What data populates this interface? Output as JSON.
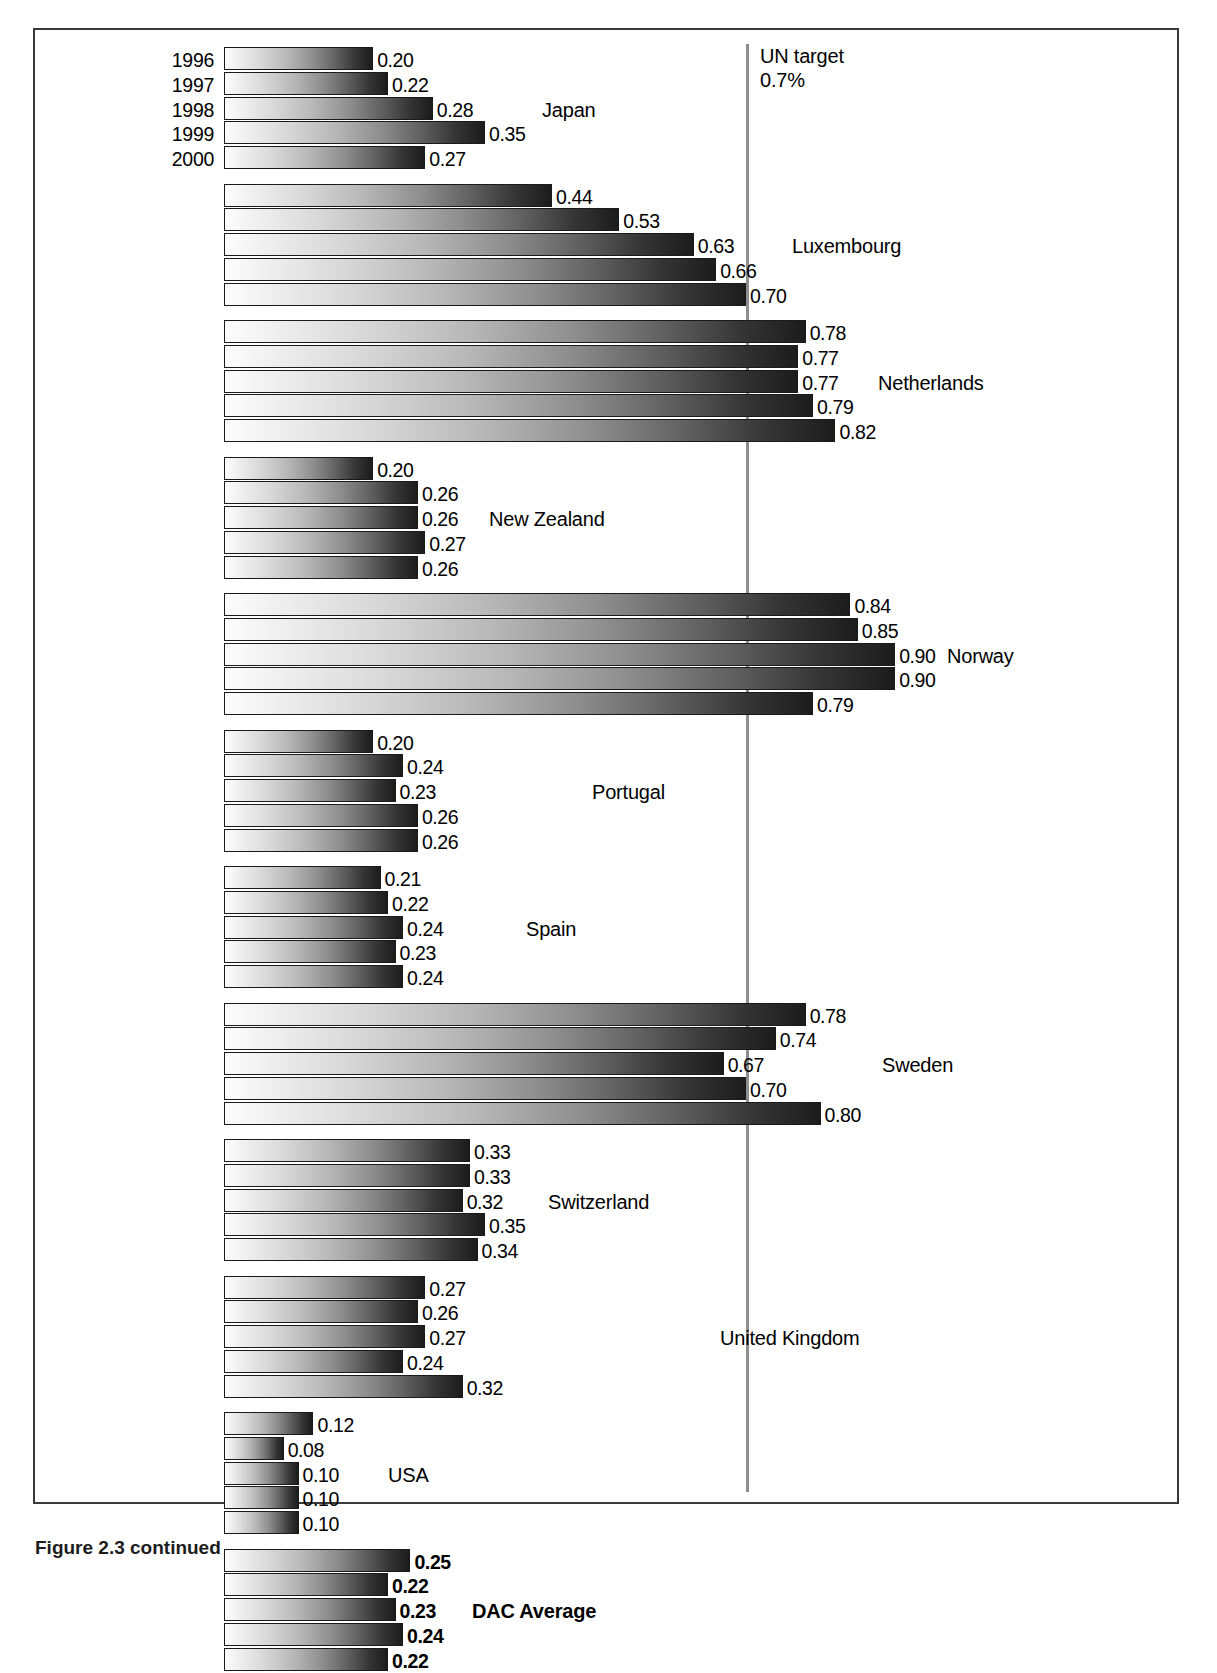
{
  "figure": {
    "caption": "Figure 2.3 continued",
    "years": [
      "1996",
      "1997",
      "1998",
      "1999",
      "2000"
    ],
    "reference_line": {
      "label_line1": "UN target",
      "label_line2": "0.7%",
      "value": 0.7
    }
  },
  "chart_data": {
    "type": "bar",
    "orientation": "horizontal",
    "title": "",
    "xlabel": "",
    "ylabel": "",
    "xlim": [
      0,
      0.9
    ],
    "grid": false,
    "legend": "none",
    "categories": [
      "1996",
      "1997",
      "1998",
      "1999",
      "2000"
    ],
    "reference_line": {
      "label": "UN target 0.7%",
      "value": 0.7
    },
    "groups": [
      {
        "name": "Japan",
        "bold": false,
        "values": [
          0.2,
          0.22,
          0.28,
          0.35,
          0.27
        ],
        "labels": [
          "0.20",
          "0.22",
          "0.28",
          "0.35",
          "0.27"
        ]
      },
      {
        "name": "Luxembourg",
        "bold": false,
        "values": [
          0.44,
          0.53,
          0.63,
          0.66,
          0.7
        ],
        "labels": [
          "0.44",
          "0.53",
          "0.63",
          "0.66",
          "0.70"
        ]
      },
      {
        "name": "Netherlands",
        "bold": false,
        "values": [
          0.78,
          0.77,
          0.77,
          0.79,
          0.82
        ],
        "labels": [
          "0.78",
          "0.77",
          "0.77",
          "0.79",
          "0.82"
        ]
      },
      {
        "name": "New Zealand",
        "bold": false,
        "values": [
          0.2,
          0.26,
          0.26,
          0.27,
          0.26
        ],
        "labels": [
          "0.20",
          "0.26",
          "0.26",
          "0.27",
          "0.26"
        ]
      },
      {
        "name": "Norway",
        "bold": false,
        "values": [
          0.84,
          0.85,
          0.9,
          0.9,
          0.79
        ],
        "labels": [
          "0.84",
          "0.85",
          "0.90",
          "0.90",
          "0.79"
        ]
      },
      {
        "name": "Portugal",
        "bold": false,
        "values": [
          0.2,
          0.24,
          0.23,
          0.26,
          0.26
        ],
        "labels": [
          "0.20",
          "0.24",
          "0.23",
          "0.26",
          "0.26"
        ]
      },
      {
        "name": "Spain",
        "bold": false,
        "values": [
          0.21,
          0.22,
          0.24,
          0.23,
          0.24
        ],
        "labels": [
          "0.21",
          "0.22",
          "0.24",
          "0.23",
          "0.24"
        ]
      },
      {
        "name": "Sweden",
        "bold": false,
        "values": [
          0.78,
          0.74,
          0.67,
          0.7,
          0.8
        ],
        "labels": [
          "0.78",
          "0.74",
          "0.67",
          "0.70",
          "0.80"
        ]
      },
      {
        "name": "Switzerland",
        "bold": false,
        "values": [
          0.33,
          0.33,
          0.32,
          0.35,
          0.34
        ],
        "labels": [
          "0.33",
          "0.33",
          "0.32",
          "0.35",
          "0.34"
        ]
      },
      {
        "name": "United Kingdom",
        "bold": false,
        "values": [
          0.27,
          0.26,
          0.27,
          0.24,
          0.32
        ],
        "labels": [
          "0.27",
          "0.26",
          "0.27",
          "0.24",
          "0.32"
        ]
      },
      {
        "name": "USA",
        "bold": false,
        "values": [
          0.12,
          0.08,
          0.1,
          0.1,
          0.1
        ],
        "labels": [
          "0.12",
          "0.08",
          "0.10",
          "0.10",
          "0.10"
        ]
      },
      {
        "name": "DAC Average",
        "bold": true,
        "values": [
          0.25,
          0.22,
          0.23,
          0.24,
          0.22
        ],
        "labels": [
          "0.25",
          "0.22",
          "0.23",
          "0.24",
          "0.22"
        ]
      }
    ],
    "label_x_offsets": [
      [
        null,
        null,
        null,
        null,
        null
      ],
      [
        null,
        null,
        null,
        null,
        null
      ],
      [
        null,
        null,
        null,
        null,
        null
      ],
      [
        null,
        null,
        null,
        null,
        null
      ],
      [
        null,
        null,
        null,
        null,
        null
      ],
      [
        null,
        null,
        null,
        null,
        null
      ],
      [
        null,
        null,
        null,
        null,
        null
      ],
      [
        null,
        null,
        null,
        null,
        null
      ],
      [
        null,
        null,
        null,
        null,
        null
      ],
      [
        null,
        null,
        null,
        null,
        null
      ],
      [
        null,
        null,
        null,
        null,
        null
      ],
      [
        null,
        null,
        null,
        null,
        null
      ]
    ],
    "series_label_x": [
      540,
      790,
      876,
      487,
      945,
      590,
      524,
      880,
      546,
      718,
      386,
      470
    ],
    "colors": {
      "bar_gradient_start": "#fdfdfd",
      "bar_gradient_end": "#1c1c1c",
      "bar_border": "#1a1a1a",
      "reference_line": "#8e8e8e",
      "frame_border": "#3a3a3a",
      "text": "#000000",
      "background": "#ffffff"
    }
  }
}
